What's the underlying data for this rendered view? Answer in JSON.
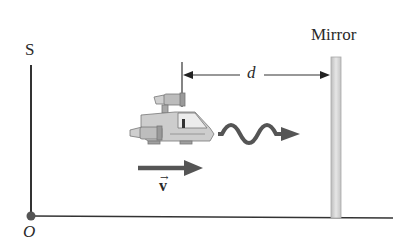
{
  "diagram": {
    "type": "physics-illustration",
    "labels": {
      "vertical_axis": "S",
      "origin": "O",
      "mirror": "Mirror",
      "distance": "d",
      "velocity": "v",
      "velocity_vector_mark": "→"
    },
    "elements": [
      {
        "id": "vertical-axis",
        "kind": "line",
        "label": "S"
      },
      {
        "id": "horizontal-axis",
        "kind": "line"
      },
      {
        "id": "origin-point",
        "kind": "dot",
        "label": "O"
      },
      {
        "id": "spacecraft",
        "kind": "illustration"
      },
      {
        "id": "light-pulse",
        "kind": "wavy-arrow",
        "direction": "right"
      },
      {
        "id": "velocity-vector",
        "kind": "arrow",
        "direction": "right",
        "label": "v"
      },
      {
        "id": "distance-marker",
        "kind": "dimension",
        "label": "d"
      },
      {
        "id": "mirror",
        "kind": "vertical-bar",
        "label": "Mirror"
      }
    ],
    "colors": {
      "line": "#333333",
      "arrow": "#4d4d4d",
      "mirror_fill": "#d9d9d9",
      "ship_body": "#c8c8c8",
      "ship_dark": "#8a8a8a"
    }
  }
}
